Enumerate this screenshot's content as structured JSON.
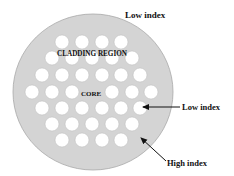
{
  "diagram": {
    "type": "photonic-crystal-fiber-cross-section",
    "fiber": {
      "cx": 93,
      "cy": 92,
      "rx": 80,
      "ry": 78,
      "fill": "#d4d4d4",
      "stroke": "#a8a8a8"
    },
    "hole_radius": 7,
    "hole_fill": "#ffffff",
    "hole_rows": [
      {
        "y": 42,
        "x": [
          62,
          82,
          102,
          121
        ]
      },
      {
        "y": 58,
        "x": [
          52,
          72,
          92,
          112,
          132
        ]
      },
      {
        "y": 75,
        "x": [
          42,
          62,
          82,
          102,
          121,
          140
        ]
      },
      {
        "y": 92,
        "x": [
          32,
          52,
          72,
          112,
          132,
          151
        ]
      },
      {
        "y": 108,
        "x": [
          42,
          62,
          82,
          102,
          121,
          140
        ]
      },
      {
        "y": 124,
        "x": [
          52,
          72,
          92,
          112,
          132
        ]
      },
      {
        "y": 140,
        "x": [
          62,
          82,
          102,
          121
        ]
      }
    ],
    "labels": {
      "top_low_index": "Low index",
      "cladding_region": "CLADDING REGION",
      "core": "CORE",
      "right_low_index": "Low index",
      "high_index": "High index"
    },
    "arrows": [
      {
        "name": "low-index-arrow",
        "from": [
          180,
          107
        ],
        "to": [
          143,
          107
        ]
      },
      {
        "name": "high-index-arrow",
        "from": [
          166,
          161
        ],
        "to": [
          141,
          138
        ]
      }
    ]
  }
}
